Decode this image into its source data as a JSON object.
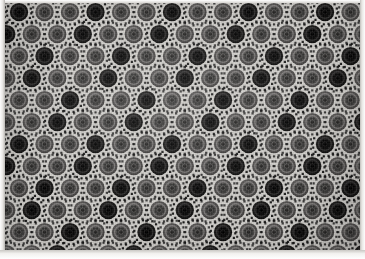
{
  "image": {
    "subject": "patterned-textile-swatch",
    "description": "Repeating grid of circular sunburst medallions with dotted rings on light gray cloth",
    "width": 365,
    "height": 259
  },
  "palette": {
    "background_cloth": "#cfcdc9",
    "medallion_light": "#4f4d4c",
    "medallion_dark": "#141414",
    "dot_color": "#111111",
    "ring_inner": "#6a6866",
    "paper_white": "#ffffff",
    "edge_gray": "#e7e5e2"
  },
  "pattern": {
    "motif_name": "sunburst-medallion",
    "columns": 15,
    "rows": 12,
    "cell_width": 25.5,
    "cell_height": 22.0,
    "row_offset": 12.75,
    "medallion_radius": 9.2,
    "spike_count": 16,
    "spike_size": 2.2,
    "filler_dot_size": 2.6,
    "dark_every_n_columns": 3,
    "dark_row_shift": 1
  },
  "edges": {
    "left_margin_label": "left-paper-edge",
    "right_margin_label": "right-paper-edge",
    "bottom_margin_label": "bottom-paper-edge",
    "top_margin_label": "top-paper-edge"
  }
}
